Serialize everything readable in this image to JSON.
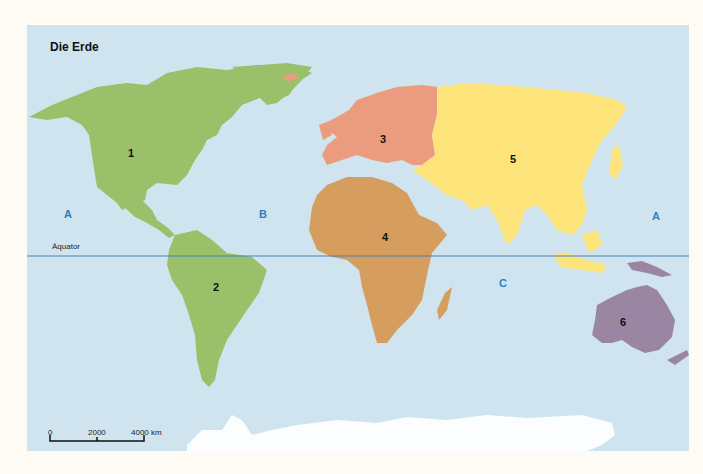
{
  "title": "Die Erde",
  "equator": {
    "label": "Äquator",
    "color": "#4a7fb5"
  },
  "continents": [
    {
      "number": "1",
      "name": "North America",
      "color": "#9bc06a"
    },
    {
      "number": "2",
      "name": "South America",
      "color": "#9bc06a"
    },
    {
      "number": "3",
      "name": "Europe",
      "color": "#ec9c7e"
    },
    {
      "number": "4",
      "name": "Africa",
      "color": "#d59e5e"
    },
    {
      "number": "5",
      "name": "Asia",
      "color": "#fde47a"
    },
    {
      "number": "6",
      "name": "Australia",
      "color": "#9a86a2"
    }
  ],
  "oceans": [
    {
      "letter": "A",
      "position": "west"
    },
    {
      "letter": "B",
      "position": "atlantic"
    },
    {
      "letter": "C",
      "position": "indian"
    },
    {
      "letter": "A",
      "position": "east"
    }
  ],
  "scale_bar": {
    "labels": [
      "0",
      "2000",
      "4000 km"
    ]
  },
  "colors": {
    "ocean": "#cfe4ee",
    "antarctica": "#fbfdfe",
    "background": "#fdfbf4"
  }
}
